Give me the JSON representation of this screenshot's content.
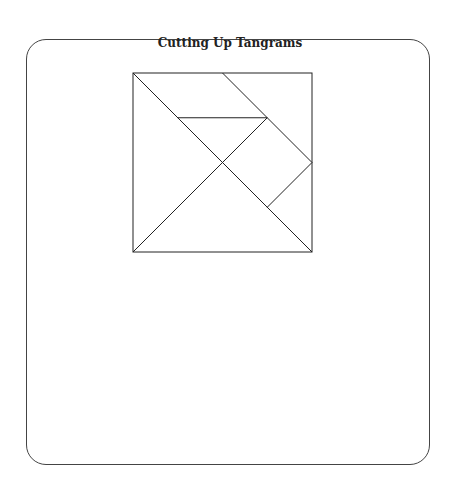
{
  "title": "Cutting Up Tangrams",
  "diagram": {
    "type": "tangram",
    "square": {
      "x": 133,
      "y": 73,
      "size": 179
    },
    "stroke_color": "#222222",
    "lines_units": [
      {
        "from": [
          0,
          0
        ],
        "to": [
          4,
          4
        ],
        "desc": "main diagonal"
      },
      {
        "from": [
          2,
          0
        ],
        "to": [
          4,
          2
        ],
        "desc": "top-right corner cut"
      },
      {
        "from": [
          1,
          1
        ],
        "to": [
          3,
          1
        ],
        "desc": "horizontal cut"
      },
      {
        "from": [
          0,
          4
        ],
        "to": [
          3,
          1
        ],
        "desc": "anti-diagonal cut"
      },
      {
        "from": [
          4,
          2
        ],
        "to": [
          3,
          3
        ],
        "desc": "square/triangle cut"
      }
    ]
  }
}
